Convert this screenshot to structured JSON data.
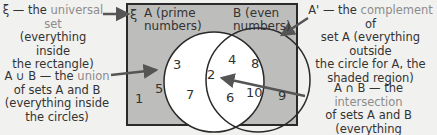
{
  "diagram": {
    "universal_symbol": "ξ",
    "set_a": {
      "name": "A",
      "desc": "(prime",
      "desc2": "numbers)"
    },
    "set_b": {
      "name": "B",
      "desc": "(even",
      "desc2": "numbers)"
    },
    "numbers": {
      "only_a": [
        "3",
        "5",
        "7"
      ],
      "both": [
        "2"
      ],
      "only_b": [
        "4",
        "8",
        "6",
        "10"
      ],
      "outside": [
        "1",
        "9"
      ]
    },
    "colors": {
      "shaded": "#bdbdbb",
      "circle_a_fill": "#ffffff",
      "border": "#2a2a2a",
      "highlight_text": "#8c8c8c",
      "background": "#f1f1ef"
    }
  },
  "annotations": {
    "universal": {
      "symbol": "ξ — the ",
      "term": "universal set",
      "rest1": "(everything inside",
      "rest2": "the rectangle)"
    },
    "complement": {
      "symbol": "A' — the ",
      "term": "complement",
      "after": " of",
      "rest1": "set A (everything outside",
      "rest2": "the circle for A, the",
      "rest3": "shaded region)"
    },
    "union": {
      "symbol": "A ∪ B — the ",
      "term": "union",
      "rest1": "of sets A and B",
      "rest2": "(everything inside",
      "rest3": "the circles)"
    },
    "intersection": {
      "symbol": "A ∩ B — the ",
      "term": "intersection",
      "rest1": "of sets A and B (everything",
      "rest2": "in the overlap)"
    }
  }
}
